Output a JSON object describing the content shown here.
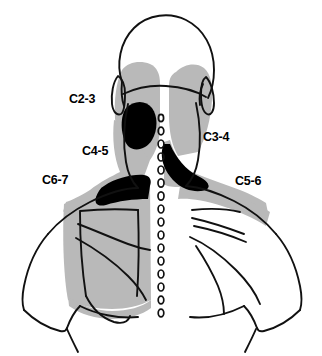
{
  "figure": {
    "view": "posterior view of head, neck and shoulders",
    "type": "medical-line-drawing"
  },
  "labels": [
    {
      "id": "c2-3",
      "text": "C2-3",
      "side": "left",
      "region": "upper posterior neck / suboccipital"
    },
    {
      "id": "c3-4",
      "text": "C3-4",
      "side": "right",
      "region": "mid posterior neck"
    },
    {
      "id": "c4-5",
      "text": "C4-5",
      "side": "left",
      "region": "lower neck / upper trapezius"
    },
    {
      "id": "c5-6",
      "text": "C5-6",
      "side": "right",
      "region": "supraspinous fossa / shoulder"
    },
    {
      "id": "c6-7",
      "text": "C6-7",
      "side": "left",
      "region": "scapular / interscapular"
    }
  ],
  "legend": {
    "grey_fill_meaning": "referral zone",
    "black_fill_meaning": "most intense referral zone",
    "grey_color": "#b9b9b9",
    "black_color": "#000000",
    "outline_color": "#111111",
    "background_color": "#ffffff"
  },
  "spine": {
    "name": "spinous process column",
    "marker_glyph": "o",
    "marker_count": 16
  },
  "anatomy_parts": [
    "head-outline",
    "left-ear",
    "right-ear",
    "neck",
    "left-shoulder",
    "right-shoulder",
    "left-sleeve",
    "right-sleeve",
    "left-scapula-contour",
    "right-scapula-contour"
  ]
}
